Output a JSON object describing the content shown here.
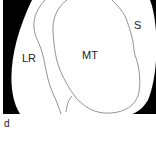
{
  "panel": {
    "label": "d"
  },
  "regions": [
    {
      "id": "LR",
      "label": "LR"
    },
    {
      "id": "MT",
      "label": "MT"
    },
    {
      "id": "S",
      "label": "S"
    }
  ],
  "colors": {
    "background": "#ffffff",
    "mask": "#000000",
    "outline": "#777777",
    "text": "#222222"
  }
}
